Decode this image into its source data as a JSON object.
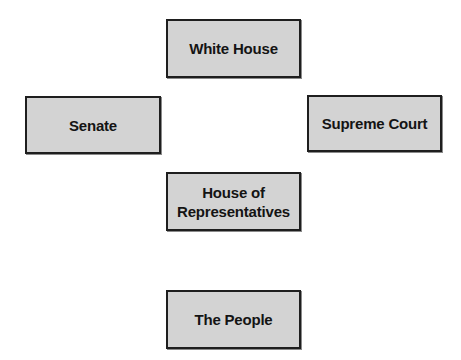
{
  "diagram": {
    "nodes": [
      {
        "id": "white-house",
        "label": "White House"
      },
      {
        "id": "senate",
        "label": "Senate"
      },
      {
        "id": "supreme-court",
        "label": "Supreme Court"
      },
      {
        "id": "house",
        "label": "House of\nRepresentatives"
      },
      {
        "id": "people",
        "label": "The People"
      }
    ],
    "colors": {
      "box_fill": "#d3d3d3",
      "box_border": "#1e1e1e",
      "text": "#141414",
      "background": "#ffffff"
    }
  }
}
